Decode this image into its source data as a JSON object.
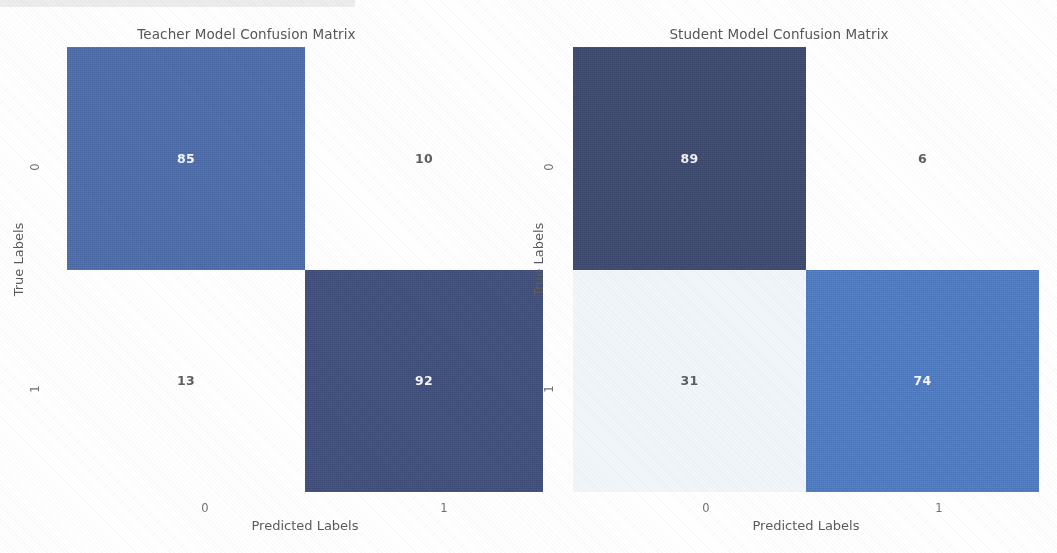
{
  "background_color": "#ffffff",
  "top_strip_color": "#ededee",
  "axis": {
    "xlabel": "Predicted Labels",
    "ylabel": "True Labels",
    "xticks": [
      "0",
      "1"
    ],
    "yticks": [
      "0",
      "1"
    ]
  },
  "chart_data": [
    {
      "type": "heatmap",
      "title": "Teacher Model Confusion Matrix",
      "xlabel": "Predicted Labels",
      "ylabel": "True Labels",
      "xticklabels": [
        "0",
        "1"
      ],
      "yticklabels": [
        "0",
        "1"
      ],
      "matrix": [
        [
          85,
          10
        ],
        [
          13,
          92
        ]
      ],
      "cells": [
        {
          "row": 0,
          "col": 0,
          "value": "85",
          "fill": "#4c6da8",
          "text_color": "#f2f4fa"
        },
        {
          "row": 0,
          "col": 1,
          "value": "10",
          "fill": "#ffffff",
          "text_color": "#5c5e60"
        },
        {
          "row": 1,
          "col": 0,
          "value": "13",
          "fill": "#ffffff",
          "text_color": "#5c5e60"
        },
        {
          "row": 1,
          "col": 1,
          "value": "92",
          "fill": "#404f7e",
          "text_color": "#f2f4fa"
        }
      ],
      "colormap": "Blues",
      "grid": false,
      "legend": "none"
    },
    {
      "type": "heatmap",
      "title": "Student Model Confusion Matrix",
      "xlabel": "Predicted Labels",
      "ylabel": "True Labels",
      "xticklabels": [
        "0",
        "1"
      ],
      "yticklabels": [
        "0",
        "1"
      ],
      "matrix": [
        [
          89,
          6
        ],
        [
          31,
          74
        ]
      ],
      "cells": [
        {
          "row": 0,
          "col": 0,
          "value": "89",
          "fill": "#3e4a72",
          "text_color": "#eef0f7"
        },
        {
          "row": 0,
          "col": 1,
          "value": "6",
          "fill": "#ffffff",
          "text_color": "#5c5e60"
        },
        {
          "row": 1,
          "col": 0,
          "value": "31",
          "fill": "#f1f6fb",
          "text_color": "#5c5e60"
        },
        {
          "row": 1,
          "col": 1,
          "value": "74",
          "fill": "#4f7ac0",
          "text_color": "#f4f6fb"
        }
      ],
      "colormap": "Blues",
      "grid": false,
      "legend": "none"
    }
  ]
}
